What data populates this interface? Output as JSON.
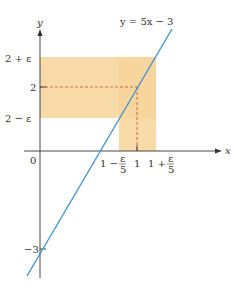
{
  "diagram": {
    "equation_label": "y = 5x − 3",
    "axes": {
      "x_label": "x",
      "y_label": "y",
      "origin_label": "0"
    },
    "y_ticks": [
      {
        "label": "2 + ε",
        "value": "2+eps"
      },
      {
        "label": "2",
        "value": "2"
      },
      {
        "label": "2 − ε",
        "value": "2-eps"
      },
      {
        "label": "−3",
        "value": "-3"
      }
    ],
    "x_ticks": [
      {
        "label_main": "1 −",
        "frac_num": "ε",
        "frac_den": "5"
      },
      {
        "label_main": "1"
      },
      {
        "label_main": "1 +",
        "frac_num": "ε",
        "frac_den": "5"
      }
    ],
    "colors": {
      "band": "#f7d39a",
      "line": "#3a8fd4",
      "dash": "#c0522a",
      "axis": "#333333"
    }
  }
}
